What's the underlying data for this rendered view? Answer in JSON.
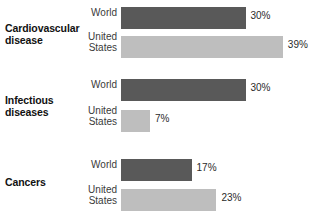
{
  "chart_data": {
    "type": "bar",
    "title": "",
    "subtitle": "",
    "xlabel": "",
    "ylabel": "",
    "orientation": "horizontal",
    "grid": false,
    "legend_position": "inline-row-labels",
    "value_suffix": "%",
    "xlim": [
      0,
      45
    ],
    "px_per_percent": 4.15,
    "categories": [
      "Cardiovascular disease",
      "Infectious diseases",
      "Cancers"
    ],
    "series": [
      {
        "name": "World",
        "color": "#595959",
        "values": [
          30,
          30,
          17
        ]
      },
      {
        "name": "United States",
        "color": "#bebebe",
        "values": [
          39,
          7,
          23
        ]
      }
    ],
    "groups": [
      {
        "category": "Cardiovascular disease",
        "bars": [
          {
            "series": "World",
            "series_line1": "World",
            "series_line2": "",
            "value": 30,
            "value_label": "30%",
            "color": "#595959"
          },
          {
            "series": "United States",
            "series_line1": "United",
            "series_line2": "States",
            "value": 39,
            "value_label": "39%",
            "color": "#bebebe"
          }
        ]
      },
      {
        "category": "Infectious diseases",
        "bars": [
          {
            "series": "World",
            "series_line1": "World",
            "series_line2": "",
            "value": 30,
            "value_label": "30%",
            "color": "#595959"
          },
          {
            "series": "United States",
            "series_line1": "United",
            "series_line2": "States",
            "value": 7,
            "value_label": "7%",
            "color": "#bebebe"
          }
        ]
      },
      {
        "category": "Cancers",
        "bars": [
          {
            "series": "World",
            "series_line1": "World",
            "series_line2": "",
            "value": 17,
            "value_label": "17%",
            "color": "#595959"
          },
          {
            "series": "United States",
            "series_line1": "United",
            "series_line2": "States",
            "value": 23,
            "value_label": "23%",
            "color": "#bebebe"
          }
        ]
      }
    ]
  },
  "colors": {
    "world_bar": "#595959",
    "us_bar": "#bebebe",
    "background": "#ffffff",
    "text": "#1a1a1a"
  }
}
